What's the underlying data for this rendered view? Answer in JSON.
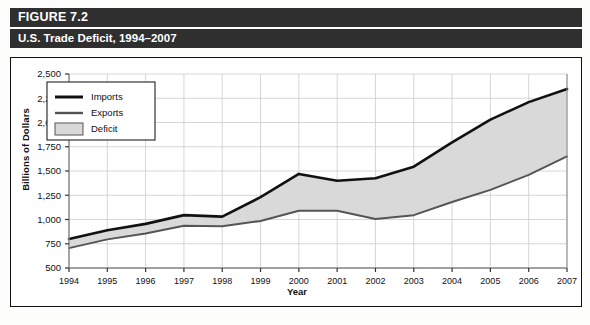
{
  "figure": {
    "label": "FIGURE 7.2",
    "title": "U.S. Trade Deficit, 1994–2007"
  },
  "colors": {
    "header_bg": "#2f2f2f",
    "header_text": "#ffffff",
    "imports_line": "#111111",
    "exports_line": "#555555",
    "deficit_fill": "#d9d9d9",
    "grid": "#cccccc",
    "axis": "#888888"
  },
  "legend": {
    "items": [
      {
        "label": "Imports",
        "type": "line",
        "color": "#111111"
      },
      {
        "label": "Exports",
        "type": "line",
        "color": "#555555"
      },
      {
        "label": "Deficit",
        "type": "swatch",
        "color": "#d9d9d9"
      }
    ]
  },
  "chart_data": {
    "type": "area",
    "title": "U.S. Trade Deficit, 1994–2007",
    "xlabel": "Year",
    "ylabel": "Billions of Dollars",
    "categories": [
      "1994",
      "1995",
      "1996",
      "1997",
      "1998",
      "1999",
      "2000",
      "2001",
      "2002",
      "2003",
      "2004",
      "2005",
      "2006",
      "2007"
    ],
    "ylim": [
      500,
      2500
    ],
    "yticks": [
      500,
      750,
      1000,
      1250,
      1500,
      1750,
      2000,
      2250,
      2500
    ],
    "ytick_labels": [
      "500",
      "750",
      "1,000",
      "1,250",
      "1,500",
      "1,750",
      "2,000",
      "2,250",
      "2,500"
    ],
    "grid": true,
    "legend_position": "top-left",
    "series": [
      {
        "name": "Imports",
        "color": "#111111",
        "values": [
          800,
          890,
          955,
          1045,
          1030,
          1230,
          1470,
          1400,
          1425,
          1545,
          1795,
          2030,
          2210,
          2345
        ]
      },
      {
        "name": "Exports",
        "color": "#555555",
        "values": [
          705,
          795,
          855,
          935,
          930,
          985,
          1090,
          1090,
          1005,
          1045,
          1180,
          1305,
          1460,
          1650
        ]
      }
    ],
    "band": {
      "name": "Deficit",
      "color": "#d9d9d9",
      "between": [
        "Imports",
        "Exports"
      ],
      "values": [
        95,
        95,
        100,
        110,
        100,
        245,
        380,
        310,
        420,
        500,
        615,
        725,
        750,
        695
      ]
    }
  }
}
